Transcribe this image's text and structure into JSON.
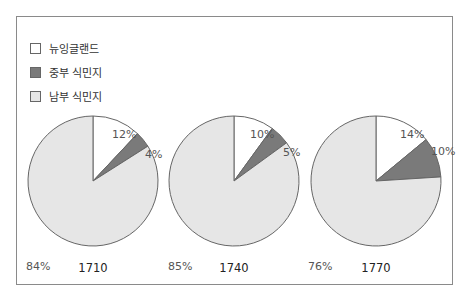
{
  "chart_data": {
    "type": "pie",
    "legend": [
      {
        "label": "뉴잉글랜드",
        "color": "#ffffff"
      },
      {
        "label": "중부 식민지",
        "color": "#7a7a7a"
      },
      {
        "label": "남부 식민지",
        "color": "#e6e6e6"
      }
    ],
    "legend_position": "top-left",
    "charts": [
      {
        "title": "1710",
        "slices": [
          {
            "name": "뉴잉글랜드",
            "value": 12,
            "label": "12%"
          },
          {
            "name": "중부 식민지",
            "value": 4,
            "label": "4%"
          },
          {
            "name": "남부 식민지",
            "value": 84,
            "label": "84%"
          }
        ]
      },
      {
        "title": "1740",
        "slices": [
          {
            "name": "뉴잉글랜드",
            "value": 10,
            "label": "10%"
          },
          {
            "name": "중부 식민지",
            "value": 5,
            "label": "5%"
          },
          {
            "name": "남부 식민지",
            "value": 85,
            "label": "85%"
          }
        ]
      },
      {
        "title": "1770",
        "slices": [
          {
            "name": "뉴잉글랜드",
            "value": 14,
            "label": "14%"
          },
          {
            "name": "중부 식민지",
            "value": 10,
            "label": "10%"
          },
          {
            "name": "남부 식민지",
            "value": 76,
            "label": "76%"
          }
        ]
      }
    ]
  }
}
